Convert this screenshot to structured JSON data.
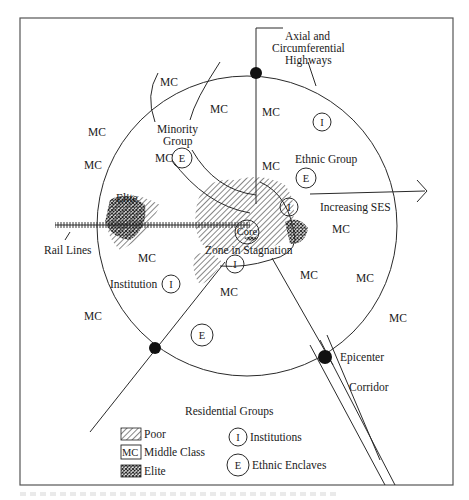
{
  "figure": {
    "type": "urban-structure-model",
    "labels": {
      "axial_highways": "Axial and",
      "axial_highways_2": "Circumferential",
      "axial_highways_3": "Highways",
      "minority_group_1": "Minority",
      "minority_group_2": "Group",
      "ethnic_group": "Ethnic Group",
      "increasing_ses": "Increasing SES",
      "elite": "Elite",
      "rail_lines": "Rail Lines",
      "core": "Core",
      "zone_in_stagnation": "Zone in Stagnation",
      "institution": "Institution",
      "epicenter": "Epicenter",
      "corridor": "Corridor"
    },
    "mc_label": "MC",
    "mc_positions_count": 16,
    "institution_marker": "I",
    "ethnic_marker": "E"
  },
  "legend": {
    "title": "Residential Groups",
    "items": [
      {
        "symbol": "hatch-diagonal",
        "label": "Poor"
      },
      {
        "symbol": "MC",
        "label": "Middle Class"
      },
      {
        "symbol": "hatch-cross",
        "label": "Elite"
      },
      {
        "symbol": "I",
        "label": "Institutions"
      },
      {
        "symbol": "E",
        "label": "Ethnic Enclaves"
      }
    ]
  },
  "colors": {
    "ink": "#1a1a1a",
    "background": "#ffffff",
    "frame": "#555555"
  }
}
